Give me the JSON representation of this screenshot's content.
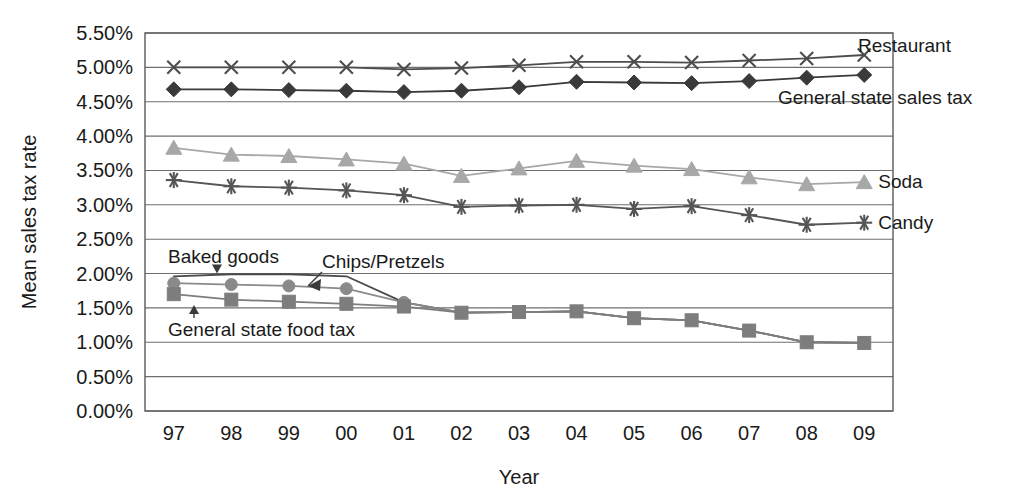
{
  "chart_data": {
    "type": "line",
    "title": "",
    "xlabel": "Year",
    "ylabel": "Mean sales tax rate",
    "x": [
      "97",
      "98",
      "99",
      "00",
      "01",
      "02",
      "03",
      "04",
      "05",
      "06",
      "07",
      "08",
      "09"
    ],
    "categories": [
      "97",
      "98",
      "99",
      "00",
      "01",
      "02",
      "03",
      "04",
      "05",
      "06",
      "07",
      "08",
      "09"
    ],
    "ylim": [
      0.0,
      5.5
    ],
    "ytick_labels": [
      "0.00%",
      "0.50%",
      "1.00%",
      "1.50%",
      "2.00%",
      "2.50%",
      "3.00%",
      "3.50%",
      "4.00%",
      "4.50%",
      "5.00%",
      "5.50%"
    ],
    "ytick_values": [
      0.0,
      0.5,
      1.0,
      1.5,
      2.0,
      2.5,
      3.0,
      3.5,
      4.0,
      4.5,
      5.0,
      5.5
    ],
    "grid": true,
    "legend_position": "right-inline-labels",
    "series": [
      {
        "name": "Restaurant",
        "marker": "x",
        "color": "#4d4d4d",
        "label_position": "right",
        "values": [
          5.0,
          5.0,
          5.0,
          5.0,
          4.97,
          4.99,
          5.03,
          5.08,
          5.08,
          5.07,
          5.1,
          5.13,
          5.18
        ]
      },
      {
        "name": "General state sales tax",
        "marker": "diamond",
        "color": "#3a3a3a",
        "label_position": "right",
        "values": [
          4.68,
          4.68,
          4.67,
          4.66,
          4.64,
          4.66,
          4.71,
          4.79,
          4.78,
          4.77,
          4.8,
          4.85,
          4.89
        ]
      },
      {
        "name": "Soda",
        "marker": "triangle",
        "color": "#a8a8a8",
        "label_position": "right",
        "values": [
          3.83,
          3.73,
          3.71,
          3.66,
          3.6,
          3.42,
          3.53,
          3.64,
          3.57,
          3.52,
          3.4,
          3.3,
          3.33
        ]
      },
      {
        "name": "Candy",
        "marker": "asterisk",
        "color": "#555555",
        "label_position": "right",
        "values": [
          3.36,
          3.27,
          3.25,
          3.21,
          3.14,
          2.97,
          2.99,
          3.0,
          2.94,
          2.98,
          2.85,
          2.71,
          2.74
        ]
      },
      {
        "name": "Baked goods",
        "marker": "none",
        "color": "#4a4a4a",
        "label_position": "annotation",
        "values": [
          1.96,
          1.99,
          1.99,
          1.96,
          1.58,
          1.43,
          1.44,
          1.45,
          1.35,
          1.32,
          1.17,
          1.0,
          0.99
        ]
      },
      {
        "name": "Chips/Pretzels",
        "marker": "circle",
        "color": "#8a8a8a",
        "label_position": "annotation",
        "values": [
          1.86,
          1.84,
          1.82,
          1.78,
          1.58,
          1.43,
          1.44,
          1.45,
          1.35,
          1.32,
          1.17,
          1.0,
          0.99
        ]
      },
      {
        "name": "General state food tax",
        "marker": "square",
        "color": "#7d7d7d",
        "label_position": "annotation",
        "values": [
          1.7,
          1.62,
          1.59,
          1.56,
          1.52,
          1.43,
          1.44,
          1.45,
          1.35,
          1.32,
          1.17,
          1.0,
          0.99
        ]
      }
    ],
    "annotations": [
      {
        "text": "Baked goods",
        "target_x": "98",
        "target_y": 2.0
      },
      {
        "text": "Chips/Pretzels",
        "target_x": "00",
        "target_y": 1.79
      },
      {
        "text": "General state food tax",
        "target_x": "98",
        "target_y": 1.6
      }
    ]
  }
}
